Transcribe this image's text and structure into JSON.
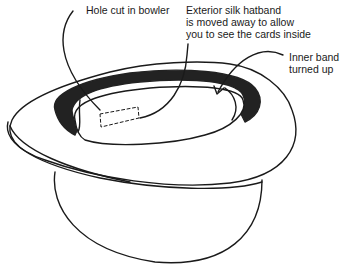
{
  "diagram": {
    "labels": {
      "hole": "Hole cut in bowler",
      "hatband": "Exterior silk hatband\nis moved away to allow\nyou to see the cards inside",
      "inner_band": "Inner band\nturned up"
    },
    "colors": {
      "line": "#1a1a1a",
      "band_fill": "#222222",
      "background": "#ffffff"
    }
  }
}
